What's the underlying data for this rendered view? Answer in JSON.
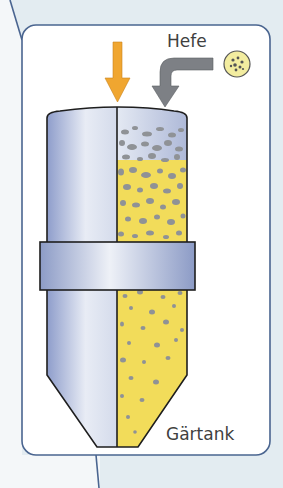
{
  "diagram": {
    "title": "Gärtank",
    "labels": {
      "yeast": "Hefe",
      "tank": "Gärtank"
    },
    "elements": [
      {
        "name": "wort-inlet-arrow",
        "color": "#f0a630",
        "direction": "down"
      },
      {
        "name": "yeast-inlet-arrow",
        "color": "#7d8085",
        "direction": "left-then-down"
      },
      {
        "name": "yeast-cell-icon",
        "color": "#f3eda0"
      },
      {
        "name": "fermentation-tank",
        "color": "#b8c3de",
        "cross_section_fill": "#f2dc5a",
        "particle_color": "#8f9296"
      }
    ],
    "colors": {
      "background": "#e3ecf1",
      "panel": "#ffffff",
      "panel_border": "#4a6590",
      "tank_steel": "#b8c3de",
      "liquid": "#f2dc5a",
      "yeast_particles": "#8f9296",
      "wort_arrow": "#f0a630",
      "yeast_arrow": "#7d8085"
    }
  }
}
